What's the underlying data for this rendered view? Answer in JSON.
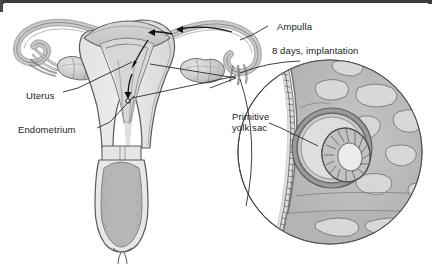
{
  "figure": {
    "title_alt": "Female reproductive tract with implantation inset",
    "labels": [
      {
        "key": "ampulla",
        "text": "Ampulla",
        "x": 277,
        "y": 21
      },
      {
        "key": "implantation",
        "text": "8 days, implantation",
        "x": 272,
        "y": 45
      },
      {
        "key": "uterus",
        "text": "Uterus",
        "x": 26,
        "y": 90
      },
      {
        "key": "endometrium",
        "text": "Endometrium",
        "x": 18,
        "y": 124
      },
      {
        "key": "primitive_yolk_sac",
        "text": "Primitive\nyolk sac",
        "x": 232,
        "y": 111
      }
    ],
    "colors": {
      "outline": "#4a4a4a",
      "tissue_light": "#dcdcdc",
      "tissue_mid": "#b8b8b8",
      "tissue_dark": "#9a9a9a",
      "tissue_darker": "#808080",
      "cavity": "#efefef",
      "background": "#ffffff",
      "leader_line": "#2a2a2a",
      "border": "#3b3b3b"
    },
    "structures": [
      "left fallopian tube",
      "left fimbriae",
      "left ovary",
      "uterine fundus",
      "uterine cavity",
      "endometrium",
      "myometrium",
      "right fallopian tube",
      "right ampulla",
      "right fimbriae",
      "right ovary",
      "cervix",
      "cervical canal",
      "vagina"
    ],
    "inset": {
      "center_x": 330,
      "center_y": 152,
      "radius": 92,
      "contents": [
        "endometrial surface epithelium",
        "decidua",
        "endometrial glands",
        "blastocyst",
        "primitive yolk sac",
        "trophoblast"
      ]
    },
    "arrows": [
      "ovum transport along right tube toward fundus",
      "descent into uterine cavity",
      "implantation site arrow"
    ]
  }
}
